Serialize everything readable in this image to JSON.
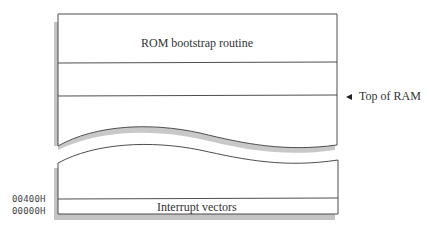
{
  "diagram": {
    "regions": [
      {
        "id": "rom",
        "label": "ROM bootstrap routine"
      },
      {
        "id": "upper-ram",
        "label": ""
      },
      {
        "id": "ram-area",
        "label": ""
      },
      {
        "id": "low-ram",
        "label": ""
      },
      {
        "id": "ivt",
        "label": "Interrupt vectors"
      }
    ],
    "markers": {
      "top_of_ram": "Top of RAM"
    },
    "addresses": {
      "ivt_top": "00400H",
      "ivt_base": "00000H"
    },
    "colors": {
      "line": "#3a3a3a",
      "shadow": "#bdbdbd",
      "background": "#ffffff"
    }
  }
}
